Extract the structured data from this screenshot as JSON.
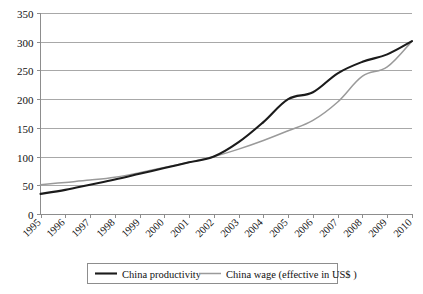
{
  "chart_data": {
    "type": "line",
    "title": "",
    "subtitle": "",
    "xlabel": "",
    "ylabel": "",
    "x": [
      1995,
      1996,
      1997,
      1998,
      1999,
      2000,
      2001,
      2002,
      2003,
      2004,
      2005,
      2006,
      2007,
      2008,
      2009,
      2010
    ],
    "categories": [
      "1995",
      "1996",
      "1997",
      "1998",
      "1999",
      "2000",
      "2001",
      "2002",
      "2003",
      "2004",
      "2005",
      "2006",
      "2007",
      "2008",
      "2009",
      "2010"
    ],
    "series": [
      {
        "name": "China productivity",
        "color": "#1b1b1b",
        "values": [
          35,
          42,
          51,
          60,
          70,
          80,
          90,
          100,
          125,
          160,
          200,
          212,
          245,
          265,
          278,
          301
        ]
      },
      {
        "name": "China wage (effective in US$ )",
        "color": "#9a9a9a",
        "values": [
          51,
          55,
          59,
          64,
          72,
          81,
          90,
          100,
          113,
          128,
          145,
          163,
          195,
          240,
          256,
          301
        ]
      }
    ],
    "ylim": [
      0,
      350
    ],
    "ytick_values": [
      0,
      50,
      100,
      150,
      200,
      250,
      300,
      350
    ],
    "ytick_labels": [
      "0",
      "50",
      "100",
      "150",
      "200",
      "250",
      "300",
      "350"
    ],
    "xlim": [
      1995,
      2010
    ],
    "grid": true,
    "grid_axis": "y",
    "legend_position": "bottom",
    "legend_entries": [
      {
        "label": "China productivity",
        "color": "#1b1b1b",
        "weight": "thick"
      },
      {
        "label": "China wage (effective in US$ )",
        "color": "#9a9a9a",
        "weight": "thin"
      }
    ],
    "xtick_label_rotation": 45,
    "background": "#ffffff"
  }
}
